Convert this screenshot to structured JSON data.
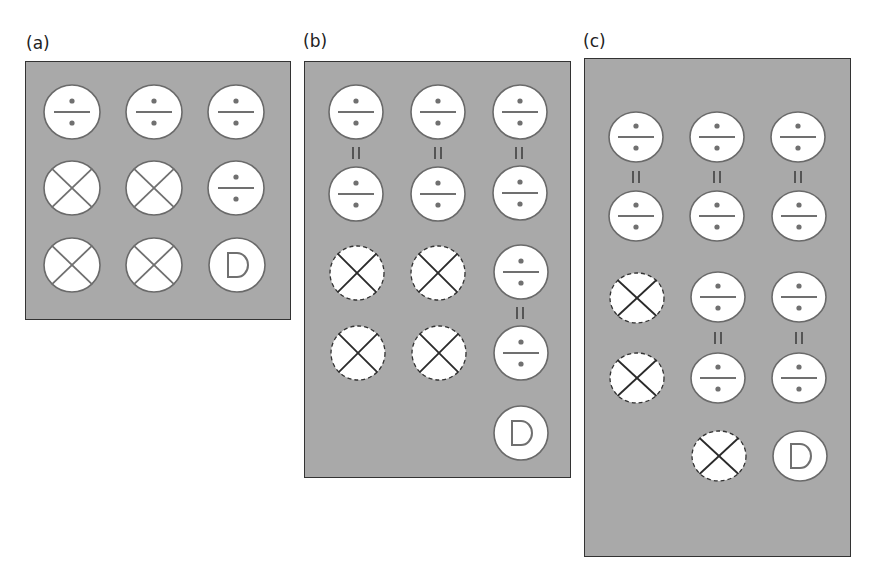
{
  "figure": {
    "colors": {
      "background": "#ffffff",
      "panel_fill": "#a9a9a9",
      "panel_border": "#333333",
      "token_fill": "#ffffff",
      "token_stroke_solid": "#6a6a6a",
      "token_stroke_dashed": "#333333",
      "glyph_gray": "#707070",
      "glyph_dark": "#2a2a2a",
      "equals_color": "#555555"
    },
    "panels": [
      {
        "id": "a",
        "label": "(a)",
        "label_pos": [
          26,
          35
        ],
        "box": [
          25,
          61,
          266,
          259
        ],
        "rx": 28,
        "ry": 27,
        "tokens": [
          {
            "type": "divide",
            "cx": 72,
            "cy": 112,
            "style": "solid"
          },
          {
            "type": "divide",
            "cx": 154,
            "cy": 112,
            "style": "solid"
          },
          {
            "type": "divide",
            "cx": 236,
            "cy": 112,
            "style": "solid"
          },
          {
            "type": "cross",
            "cx": 72,
            "cy": 188,
            "style": "solid"
          },
          {
            "type": "cross",
            "cx": 154,
            "cy": 188,
            "style": "solid"
          },
          {
            "type": "divide",
            "cx": 236,
            "cy": 188,
            "style": "solid"
          },
          {
            "type": "cross",
            "cx": 72,
            "cy": 265,
            "style": "solid"
          },
          {
            "type": "cross",
            "cx": 154,
            "cy": 265,
            "style": "solid"
          },
          {
            "type": "D",
            "cx": 237,
            "cy": 265,
            "style": "solid"
          }
        ],
        "equals": []
      },
      {
        "id": "b",
        "label": "(b)",
        "label_pos": [
          303,
          33
        ],
        "box": [
          304,
          61,
          267,
          417
        ],
        "rx": 27,
        "ry": 27,
        "tokens": [
          {
            "type": "divide",
            "cx": 356,
            "cy": 112,
            "style": "solid"
          },
          {
            "type": "divide",
            "cx": 438,
            "cy": 112,
            "style": "solid"
          },
          {
            "type": "divide",
            "cx": 520,
            "cy": 112,
            "style": "solid"
          },
          {
            "type": "divide",
            "cx": 356,
            "cy": 194,
            "style": "solid"
          },
          {
            "type": "divide",
            "cx": 438,
            "cy": 194,
            "style": "solid"
          },
          {
            "type": "divide",
            "cx": 520,
            "cy": 193,
            "style": "solid"
          },
          {
            "type": "cross",
            "cx": 357,
            "cy": 273,
            "style": "dashed"
          },
          {
            "type": "cross",
            "cx": 438,
            "cy": 273,
            "style": "dashed"
          },
          {
            "type": "divide",
            "cx": 521,
            "cy": 272,
            "style": "solid"
          },
          {
            "type": "cross",
            "cx": 358,
            "cy": 353,
            "style": "dashed"
          },
          {
            "type": "cross",
            "cx": 439,
            "cy": 353,
            "style": "dashed"
          },
          {
            "type": "divide",
            "cx": 521,
            "cy": 353,
            "style": "solid"
          },
          {
            "type": "D",
            "cx": 521,
            "cy": 433,
            "style": "solid"
          }
        ],
        "equals": [
          {
            "cx": 356,
            "cy": 153
          },
          {
            "cx": 438,
            "cy": 153
          },
          {
            "cx": 519,
            "cy": 153
          },
          {
            "cx": 520,
            "cy": 313
          }
        ]
      },
      {
        "id": "c",
        "label": "(c)",
        "label_pos": [
          583,
          33
        ],
        "box": [
          584,
          58,
          267,
          499
        ],
        "rx": 27,
        "ry": 25,
        "tokens": [
          {
            "type": "divide",
            "cx": 636,
            "cy": 137,
            "style": "solid"
          },
          {
            "type": "divide",
            "cx": 717,
            "cy": 137,
            "style": "solid"
          },
          {
            "type": "divide",
            "cx": 798,
            "cy": 137,
            "style": "solid"
          },
          {
            "type": "divide",
            "cx": 636,
            "cy": 216,
            "style": "solid"
          },
          {
            "type": "divide",
            "cx": 717,
            "cy": 216,
            "style": "solid"
          },
          {
            "type": "divide",
            "cx": 799,
            "cy": 216,
            "style": "solid"
          },
          {
            "type": "cross",
            "cx": 637,
            "cy": 298,
            "style": "dashed"
          },
          {
            "type": "divide",
            "cx": 718,
            "cy": 297,
            "style": "solid"
          },
          {
            "type": "divide",
            "cx": 799,
            "cy": 297,
            "style": "solid"
          },
          {
            "type": "cross",
            "cx": 637,
            "cy": 378,
            "style": "dashed"
          },
          {
            "type": "divide",
            "cx": 718,
            "cy": 378,
            "style": "solid"
          },
          {
            "type": "divide",
            "cx": 799,
            "cy": 378,
            "style": "solid"
          },
          {
            "type": "cross",
            "cx": 719,
            "cy": 456,
            "style": "dashed"
          },
          {
            "type": "D",
            "cx": 800,
            "cy": 456,
            "style": "solid"
          }
        ],
        "equals": [
          {
            "cx": 636,
            "cy": 177
          },
          {
            "cx": 717,
            "cy": 177
          },
          {
            "cx": 798,
            "cy": 177
          },
          {
            "cx": 718,
            "cy": 338
          },
          {
            "cx": 799,
            "cy": 338
          }
        ]
      }
    ],
    "token_legend": {
      "divide": "divide-sign token",
      "cross": "crossed-circle token",
      "D": "D-lettered token"
    }
  }
}
